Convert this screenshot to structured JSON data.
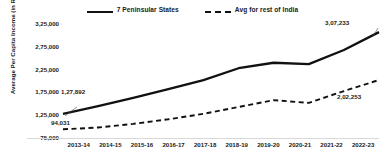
{
  "chart_data": {
    "type": "line",
    "title": "",
    "xlabel": "",
    "ylabel": "Average Per Capita Income (in Rs.)",
    "categories": [
      "2013-14",
      "2014-15",
      "2015-16",
      "2016-17",
      "2017-18",
      "2018-19",
      "2019-20",
      "2020-21",
      "2021-22",
      "2022-23"
    ],
    "ylim": [
      75000,
      325000
    ],
    "yticks": [
      75000,
      125000,
      175000,
      225000,
      275000,
      325000
    ],
    "ytick_labels": [
      "75,000",
      "1,25,000",
      "1,75,000",
      "2,25,000",
      "2,75,000",
      "3,25,000"
    ],
    "grid": false,
    "legend_position": "top-center",
    "series": [
      {
        "name": "7 Peninsular States",
        "style": "solid",
        "color": "#111111",
        "values": [
          127892,
          145000,
          163000,
          182000,
          202000,
          228000,
          240000,
          237000,
          268000,
          307233
        ]
      },
      {
        "name": "Avg for rest of India",
        "style": "dashed",
        "color": "#111111",
        "values": [
          94031,
          98000,
          106000,
          116000,
          128000,
          143000,
          158000,
          152000,
          178000,
          202253
        ]
      }
    ],
    "annotations": [
      {
        "id": "start-peninsular",
        "text": "1,27,892",
        "series": "7 Peninsular States",
        "category": "2013-14"
      },
      {
        "id": "start-rest",
        "text": "94,031",
        "series": "Avg for rest of India",
        "category": "2013-14"
      },
      {
        "id": "end-peninsular",
        "text": "3,07,233",
        "series": "7 Peninsular States",
        "category": "2022-23"
      },
      {
        "id": "end-rest",
        "text": "2,02,253",
        "series": "Avg for rest of India",
        "category": "2022-23"
      }
    ]
  },
  "legend": {
    "items": [
      {
        "label": "7 Peninsular States"
      },
      {
        "label": "Avg for rest of India"
      }
    ]
  }
}
